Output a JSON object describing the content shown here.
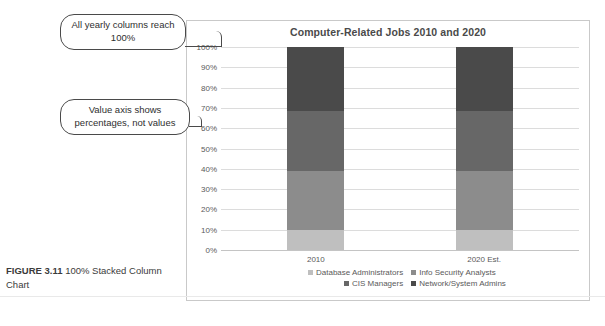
{
  "figure": {
    "label": "FIGURE 3.11",
    "caption": "100% Stacked Column Chart"
  },
  "callouts": [
    {
      "id": "callout-1",
      "text": "All yearly columns reach 100%"
    },
    {
      "id": "callout-2",
      "text": "Value axis shows percentages, not values"
    }
  ],
  "chart_data": {
    "type": "bar",
    "stacked": "100%",
    "title": "Computer-Related Jobs 2010 and 2020",
    "xlabel": "",
    "ylabel": "",
    "ylim": [
      0,
      100
    ],
    "grid": true,
    "legend_position": "bottom",
    "categories": [
      "2010",
      "2020 Est."
    ],
    "tick_labels": [
      "0%",
      "10%",
      "20%",
      "30%",
      "40%",
      "50%",
      "60%",
      "70%",
      "80%",
      "90%",
      "100%"
    ],
    "series": [
      {
        "name": "Database Administrators",
        "color": "#bfbfbf",
        "values": [
          10,
          10
        ]
      },
      {
        "name": "Info Security Analysts",
        "color": "#8c8c8c",
        "values": [
          29,
          29
        ]
      },
      {
        "name": "CIS Managers",
        "color": "#676767",
        "values": [
          29.5,
          29.5
        ]
      },
      {
        "name": "Network/System Admins",
        "color": "#4a4a4a",
        "values": [
          31.5,
          31.5
        ]
      }
    ]
  }
}
